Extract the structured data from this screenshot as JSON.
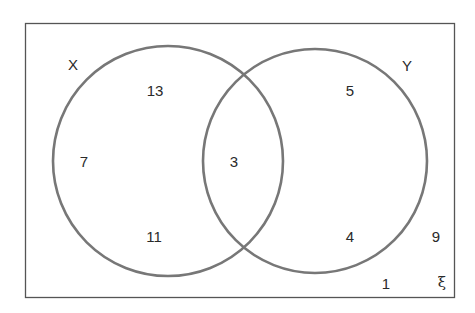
{
  "diagram": {
    "type": "venn",
    "universal_symbol": "ξ",
    "sets": [
      {
        "name": "X",
        "label": "X"
      },
      {
        "name": "Y",
        "label": "Y"
      }
    ],
    "regions": {
      "x_only": [
        "13",
        "7",
        "11"
      ],
      "intersection": [
        "3"
      ],
      "y_only": [
        "5",
        "4"
      ],
      "outside": [
        "9",
        "1"
      ]
    },
    "colors": {
      "circle_stroke": "#777777",
      "border": "#555555",
      "text": "#2a2a2a"
    }
  }
}
